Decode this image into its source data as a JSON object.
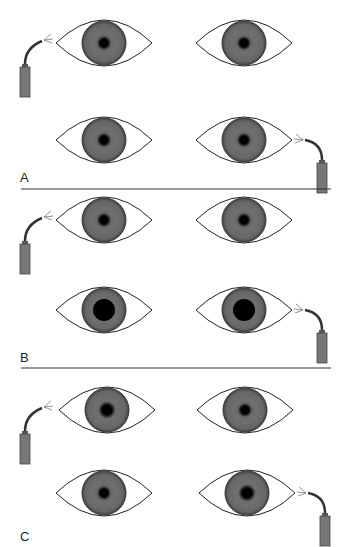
{
  "figure": {
    "colors": {
      "iris": "#6b6b6b",
      "iris_edge": "#3a3a3a",
      "pupil": "#000000",
      "eyelid": "#222222",
      "flashlight": "#777777",
      "divider": "#333333"
    },
    "panels": [
      {
        "label": "A",
        "rows": [
          {
            "light_side": "left",
            "left_pupil": "small",
            "right_pupil": "small"
          },
          {
            "light_side": "right",
            "left_pupil": "small",
            "right_pupil": "small"
          }
        ]
      },
      {
        "label": "B",
        "rows": [
          {
            "light_side": "left",
            "left_pupil": "small",
            "right_pupil": "small"
          },
          {
            "light_side": "right",
            "left_pupil": "dilated",
            "right_pupil": "dilated"
          }
        ]
      },
      {
        "label": "C",
        "rows": [
          {
            "light_side": "left",
            "left_pupil": "medium",
            "right_pupil": "small"
          },
          {
            "light_side": "right",
            "left_pupil": "small",
            "right_pupil": "medium"
          }
        ]
      }
    ]
  }
}
